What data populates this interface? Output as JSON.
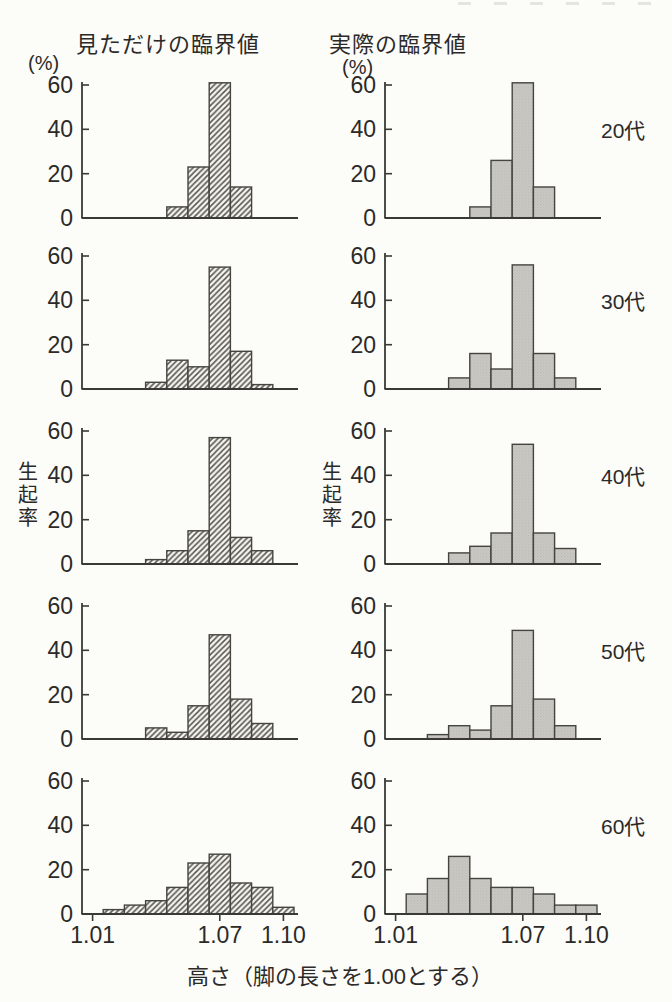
{
  "figure": {
    "column_headers": {
      "left": "見ただけの臨界値",
      "right": "実際の臨界値"
    },
    "unit_label": "(%)",
    "y_axis_label": "生起率",
    "x_axis_caption": "高さ（脚の長さを1.00とする）",
    "row_labels": [
      "20代",
      "30代",
      "40代",
      "50代",
      "60代"
    ],
    "y_ticks": [
      0,
      20,
      40,
      60
    ],
    "x_tick_labels": [
      "1.01",
      "1.07",
      "1.10"
    ],
    "x_tick_values": [
      1.01,
      1.07,
      1.1
    ],
    "colors": {
      "ink": "#2b2a28",
      "axis": "#3a3936",
      "bar_edge": "#45443f",
      "hatch_line": "#55544e",
      "hatch_bg": "#f6f5f0",
      "gray_bar_fill": "#c9c8c2",
      "background": "#fcfcf9"
    }
  },
  "chart_data": {
    "type": "bar",
    "title": "",
    "xlabel": "高さ（脚の長さを1.00とする）",
    "ylabel": "生起率 (%)",
    "ylim": [
      0,
      60
    ],
    "grid": false,
    "bins": [
      1.01,
      1.02,
      1.03,
      1.04,
      1.05,
      1.06,
      1.07,
      1.08,
      1.09,
      1.1
    ],
    "x_axis_shown_ticks": [
      1.01,
      1.07,
      1.1
    ],
    "charts": [
      {
        "key": "20s-perceived",
        "age": "20代",
        "condition": "見ただけの臨界値",
        "style": "hatched",
        "values": [
          0,
          0,
          0,
          0,
          5,
          23,
          61,
          14,
          0,
          0
        ]
      },
      {
        "key": "20s-actual",
        "age": "20代",
        "condition": "実際の臨界値",
        "style": "gray",
        "values": [
          0,
          0,
          0,
          0,
          5,
          26,
          61,
          14,
          0,
          0
        ]
      },
      {
        "key": "30s-perceived",
        "age": "30代",
        "condition": "見ただけの臨界値",
        "style": "hatched",
        "values": [
          0,
          0,
          0,
          3,
          13,
          10,
          55,
          17,
          2,
          0
        ]
      },
      {
        "key": "30s-actual",
        "age": "30代",
        "condition": "実際の臨界値",
        "style": "gray",
        "values": [
          0,
          0,
          0,
          5,
          16,
          9,
          56,
          16,
          5,
          0
        ]
      },
      {
        "key": "40s-perceived",
        "age": "40代",
        "condition": "見ただけの臨界値",
        "style": "hatched",
        "values": [
          0,
          0,
          0,
          2,
          6,
          15,
          57,
          12,
          6,
          0
        ]
      },
      {
        "key": "40s-actual",
        "age": "40代",
        "condition": "実際の臨界値",
        "style": "gray",
        "values": [
          0,
          0,
          0,
          5,
          8,
          14,
          54,
          14,
          7,
          0
        ]
      },
      {
        "key": "50s-perceived",
        "age": "50代",
        "condition": "見ただけの臨界値",
        "style": "hatched",
        "values": [
          0,
          0,
          0,
          5,
          3,
          15,
          47,
          18,
          7,
          0
        ]
      },
      {
        "key": "50s-actual",
        "age": "50代",
        "condition": "実際の臨界値",
        "style": "gray",
        "values": [
          0,
          0,
          2,
          6,
          4,
          15,
          49,
          18,
          6,
          0
        ]
      },
      {
        "key": "60s-perceived",
        "age": "60代",
        "condition": "見ただけの臨界値",
        "style": "hatched",
        "values": [
          0,
          2,
          4,
          6,
          12,
          23,
          27,
          14,
          12,
          3
        ]
      },
      {
        "key": "60s-actual",
        "age": "60代",
        "condition": "実際の臨界値",
        "style": "gray",
        "values": [
          0,
          9,
          16,
          26,
          16,
          12,
          12,
          9,
          4,
          4
        ]
      }
    ]
  }
}
